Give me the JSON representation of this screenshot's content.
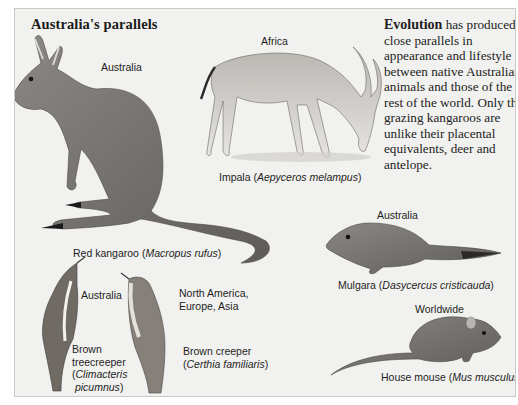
{
  "title": "Australia's parallels",
  "intro": {
    "lead": "Evolution",
    "body": " has produced close parallels in appearance and lifestyle between native Australian animals and those of the rest of the world. Only the grazing kangaroos are unlike their placental equivalents, deer and antelope."
  },
  "animals": [
    {
      "id": "red-kangaroo",
      "region": "Australia",
      "common": "Red kangaroo",
      "scientific": "Macropus rufus"
    },
    {
      "id": "impala",
      "region": "Africa",
      "common": "Impala",
      "scientific": "Aepyceros melampus"
    },
    {
      "id": "mulgara",
      "region": "Australia",
      "common": "Mulgara",
      "scientific": "Dasycercus cristicauda"
    },
    {
      "id": "brown-treecreeper",
      "region": "Australia",
      "common": "Brown treecreeper",
      "common_line1": "Brown",
      "common_line2": "treecreeper",
      "scientific": "Climacteris picumnus",
      "sci_line1": "Climacteris",
      "sci_line2": "picumnus"
    },
    {
      "id": "brown-creeper",
      "region_line1": "North America,",
      "region_line2": "Europe, Asia",
      "region": "North America, Europe, Asia",
      "common": "Brown creeper",
      "scientific": "Certhia familiaris"
    },
    {
      "id": "house-mouse",
      "region": "Worldwide",
      "common": "House mouse",
      "scientific": "Mus musculus"
    }
  ]
}
